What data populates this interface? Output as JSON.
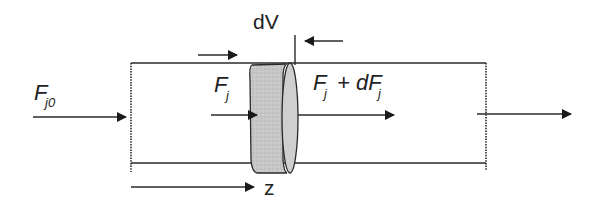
{
  "diagram": {
    "type": "plug-flow reactor differential volume balance",
    "labels": {
      "inlet_flow": "F",
      "inlet_flow_sub": "j0",
      "element_volume": "dV",
      "flow_in": "F",
      "flow_in_sub": "j",
      "flow_out_main": "F",
      "flow_out_sub1": "j",
      "flow_out_plus": "+ dF",
      "flow_out_sub2": "j",
      "axis": "z"
    },
    "colors": {
      "line": "#2a2a2a",
      "disc_fill": "#c8c8c8",
      "background": "#ffffff"
    }
  }
}
